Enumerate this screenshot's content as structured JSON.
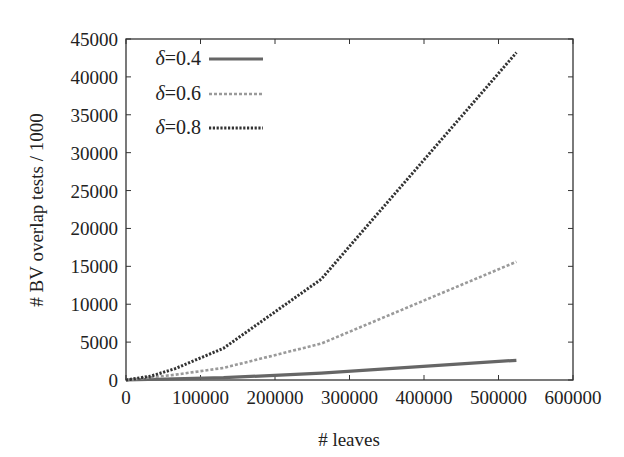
{
  "chart_data": {
    "type": "line",
    "title": "",
    "xlabel": "# leaves",
    "ylabel": "# BV overlap tests / 1000",
    "xlim": [
      0,
      600000
    ],
    "ylim": [
      0,
      45000
    ],
    "xticks": [
      0,
      100000,
      200000,
      300000,
      400000,
      500000,
      600000
    ],
    "xtick_labels": [
      "0",
      "100000",
      "200000",
      "300000",
      "400000",
      "500000",
      "600000"
    ],
    "yticks": [
      0,
      5000,
      10000,
      15000,
      20000,
      25000,
      30000,
      35000,
      40000,
      45000
    ],
    "ytick_labels": [
      "0",
      "5000",
      "10000",
      "15000",
      "20000",
      "25000",
      "30000",
      "35000",
      "40000",
      "45000"
    ],
    "grid": false,
    "legend_position": "top-left",
    "series": [
      {
        "name": "δ=0.4",
        "style": "solid",
        "color": "#666666",
        "x": [
          0,
          131000,
          262000,
          524000
        ],
        "y": [
          0,
          300,
          900,
          2600
        ]
      },
      {
        "name": "δ=0.6",
        "style": "dashed",
        "color": "#9a9a9a",
        "x": [
          0,
          66000,
          131000,
          262000,
          524000
        ],
        "y": [
          0,
          700,
          1600,
          4800,
          15600
        ]
      },
      {
        "name": "δ=0.8",
        "style": "dotted",
        "color": "#333333",
        "x": [
          0,
          33000,
          66000,
          131000,
          262000,
          524000
        ],
        "y": [
          0,
          500,
          1500,
          4200,
          13300,
          43200
        ]
      }
    ]
  },
  "legend": {
    "items": [
      {
        "symbol": "δ",
        "label": "=0.4"
      },
      {
        "symbol": "δ",
        "label": "=0.6"
      },
      {
        "symbol": "δ",
        "label": "=0.8"
      }
    ]
  }
}
